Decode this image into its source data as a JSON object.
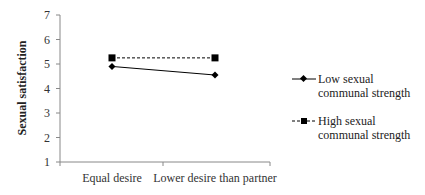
{
  "chart_data": {
    "type": "line",
    "title": "",
    "xlabel": "",
    "ylabel": "Sexual satisfaction",
    "ylim": [
      1,
      7
    ],
    "yticks": [
      1,
      2,
      3,
      4,
      5,
      6,
      7
    ],
    "categories": [
      "Equal desire",
      "Lower desire than partner"
    ],
    "series": [
      {
        "name": "Low sexual communal strength",
        "marker": "diamond",
        "line_style": "solid",
        "values": [
          4.9,
          4.55
        ]
      },
      {
        "name": "High sexual communal strength",
        "marker": "square",
        "line_style": "dashed",
        "values": [
          5.25,
          5.25
        ]
      }
    ],
    "legend_position": "right",
    "grid": false
  },
  "legend": {
    "items": [
      {
        "label": "Low sexual communal strength"
      },
      {
        "label": "High sexual communal strength"
      }
    ]
  },
  "axis": {
    "ylabel": "Sexual satisfaction"
  }
}
